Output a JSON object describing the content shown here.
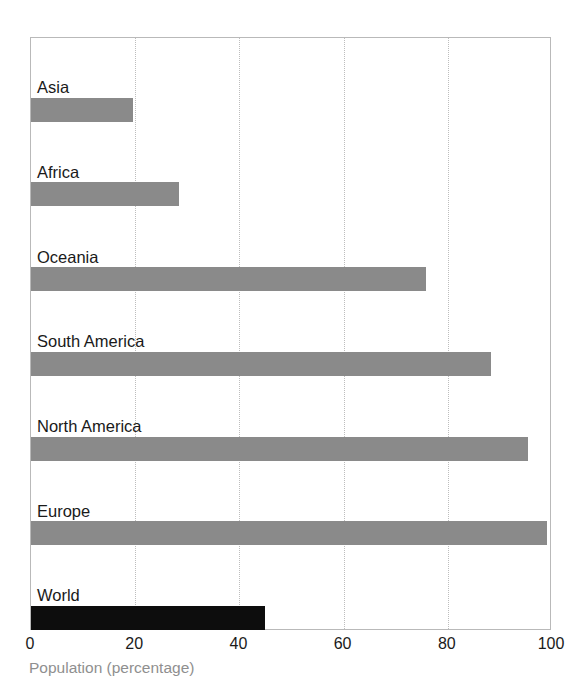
{
  "chart_data": {
    "type": "bar",
    "orientation": "horizontal",
    "title": "",
    "xlabel": "Population (percentage)",
    "ylabel": "",
    "xlim": [
      0,
      100
    ],
    "xticks": [
      0,
      20,
      40,
      60,
      80,
      100
    ],
    "gridlines": [
      20,
      40,
      60,
      80
    ],
    "grid": true,
    "legend": "none",
    "categories": [
      "Asia",
      "Africa",
      "Oceania",
      "South America",
      "North America",
      "Europe",
      "World"
    ],
    "values": [
      19.5,
      28.4,
      75.8,
      88.3,
      95.4,
      99.0,
      45.0
    ],
    "bar_colors": [
      "#8a8a8a",
      "#8a8a8a",
      "#8a8a8a",
      "#8a8a8a",
      "#8a8a8a",
      "#8a8a8a",
      "#0d0d0d"
    ],
    "series": [
      {
        "name": "Population (percentage)",
        "values": [
          19.5,
          28.4,
          75.8,
          88.3,
          95.4,
          99.0,
          45.0
        ]
      }
    ]
  },
  "axis": {
    "x_tick_labels": [
      "0",
      "20",
      "40",
      "60",
      "80",
      "100"
    ],
    "x_title": "Population (percentage)",
    "x_title_color": "#8f8f8f",
    "tick_color": "#1a1a1a"
  },
  "bars": [
    {
      "label": "Asia",
      "value": 19.5,
      "color": "#8a8a8a"
    },
    {
      "label": "Africa",
      "value": 28.4,
      "color": "#8a8a8a"
    },
    {
      "label": "Oceania",
      "value": 75.8,
      "color": "#8a8a8a"
    },
    {
      "label": "South America",
      "value": 88.3,
      "color": "#8a8a8a"
    },
    {
      "label": "North America",
      "value": 95.4,
      "color": "#8a8a8a"
    },
    {
      "label": "Europe",
      "value": 99.0,
      "color": "#8a8a8a"
    },
    {
      "label": "World",
      "value": 45.0,
      "color": "#0d0d0d"
    }
  ],
  "style": {
    "bar_gray": "#8a8a8a",
    "bar_black": "#0d0d0d",
    "frame_color": "#b9b9b9",
    "grid_color": "#bdbdbd",
    "background": "#ffffff"
  },
  "title": {
    "text": "",
    "note": "title is cropped off the top edge of the screenshot"
  }
}
